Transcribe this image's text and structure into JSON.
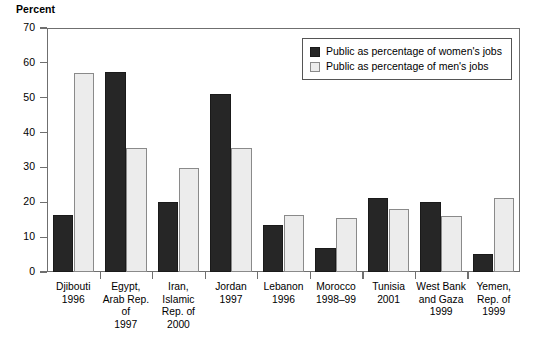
{
  "chart_data": {
    "type": "bar",
    "title": "",
    "xlabel": "",
    "ylabel": "Percent",
    "ylim": [
      0,
      70
    ],
    "yticks": [
      0,
      10,
      20,
      30,
      40,
      50,
      60,
      70
    ],
    "grid": false,
    "legend_position": "top-right",
    "categories": [
      "Djibouti\n1996",
      "Egypt,\nArab Rep. of\n1997",
      "Iran, Islamic\nRep. of\n2000",
      "Jordan\n1997",
      "Lebanon\n1996",
      "Morocco\n1998–99",
      "Tunisia\n2001",
      "West Bank\nand Gaza\n1999",
      "Yemen,\nRep. of\n1999"
    ],
    "series": [
      {
        "name": "Public as percentage of women's jobs",
        "color": "#262626",
        "values": [
          16.5,
          57.5,
          20.2,
          51.0,
          13.5,
          6.9,
          21.3,
          20.0,
          5.3
        ]
      },
      {
        "name": "Public as percentage of men's jobs",
        "color": "#ececec",
        "values": [
          57.0,
          35.7,
          29.8,
          35.5,
          16.5,
          15.5,
          18.2,
          16.2,
          21.2
        ]
      }
    ]
  },
  "legend": {
    "items": [
      {
        "label": "Public as percentage of women's jobs",
        "swatch": "women"
      },
      {
        "label": "Public as percentage of men's jobs",
        "swatch": "men"
      }
    ]
  }
}
